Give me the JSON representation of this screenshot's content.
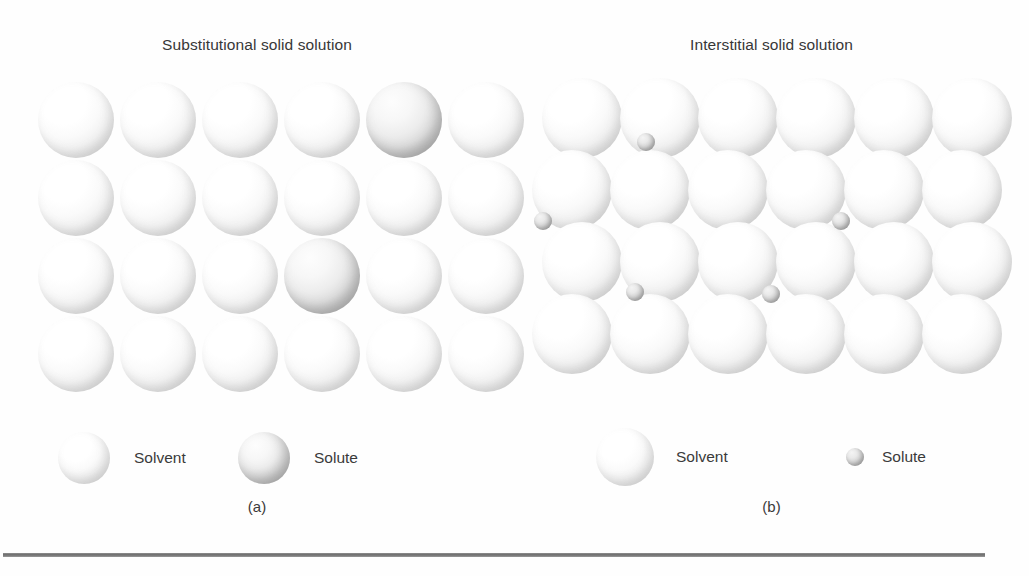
{
  "figure": {
    "background_color": "#fefefe",
    "rule_color": "#6d6d6d"
  },
  "panels": [
    {
      "id": "a",
      "title": "Substitutional solid solution",
      "caption": "(a)",
      "lattice": {
        "type": "square-grid",
        "rows": 4,
        "cols": 6,
        "sphere_diameter": 76,
        "solvent_count": 22,
        "solute_count": 2,
        "solute_positions": [
          [
            0,
            4
          ],
          [
            2,
            3
          ]
        ]
      },
      "legend": [
        {
          "marker": "large-sphere",
          "label": "Solvent",
          "size": 52
        },
        {
          "marker": "large-sphere",
          "label": "Solute",
          "size": 52
        }
      ]
    },
    {
      "id": "b",
      "title": "Interstitial solid solution",
      "caption": "(b)",
      "lattice": {
        "type": "close-packed-grid",
        "rows": 4,
        "cols": 6,
        "sphere_diameter": 80,
        "solvent_count": 24,
        "interstitial_count": 5,
        "interstitial_diameter": 18
      },
      "legend": [
        {
          "marker": "large-sphere",
          "label": "Solvent",
          "size": 58
        },
        {
          "marker": "small-sphere",
          "label": "Solute",
          "size": 18
        }
      ]
    }
  ],
  "colors": {
    "text": "#373737",
    "sphere_highlight": "#ffffff",
    "sphere_shadow": "#b4b4b4",
    "solute_shadow": "#a5a5a5"
  }
}
